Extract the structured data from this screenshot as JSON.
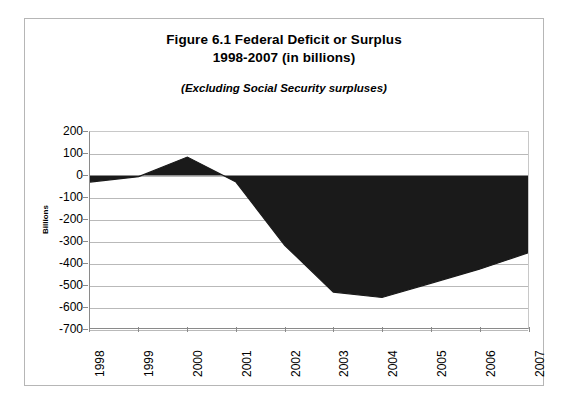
{
  "figure": {
    "title_line1": "Figure 6.1  Federal Deficit or Surplus",
    "title_line2": "1998-2007 (in billions)",
    "subtitle": "(Excluding Social Security surpluses)"
  },
  "chart_data": {
    "type": "area",
    "title": "Figure 6.1  Federal Deficit or Surplus 1998-2007 (in billions)",
    "subtitle": "(Excluding Social Security surpluses)",
    "categories": [
      "1998",
      "1999",
      "2000",
      "2001",
      "2002",
      "2003",
      "2004",
      "2005",
      "2006",
      "2007"
    ],
    "values": [
      -30,
      -5,
      85,
      -30,
      -320,
      -535,
      -560,
      -495,
      -430,
      -355
    ],
    "xlabel": "",
    "ylabel": "Billions",
    "ylim": [
      -700,
      200
    ],
    "ytick_labels": [
      "200",
      "100",
      "0",
      "-100",
      "-200",
      "-300",
      "-400",
      "-500",
      "-600",
      "-700"
    ],
    "ytick_values": [
      200,
      100,
      0,
      -100,
      -200,
      -300,
      -400,
      -500,
      -600,
      -700
    ],
    "grid": true,
    "legend": "none",
    "series_color": "#1a1a1a",
    "grid_color": "#b9b9b9",
    "axis_color": "#8a8a8a",
    "plot_background": "#ffffff"
  }
}
